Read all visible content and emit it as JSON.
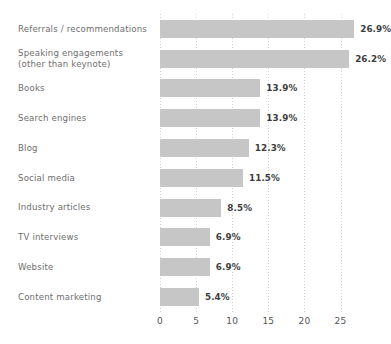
{
  "chart_data": {
    "type": "bar",
    "orientation": "horizontal",
    "title": "",
    "subtitle": "",
    "xlabel": "",
    "ylabel": "",
    "xlim": [
      0,
      28
    ],
    "xticks": [
      0,
      5,
      10,
      15,
      20,
      25
    ],
    "xtick_labels": [
      "0",
      "5",
      "10",
      "15",
      "20",
      "25"
    ],
    "grid": true,
    "grid_axis": "x",
    "grid_style": "dotted",
    "legend": false,
    "value_label_suffix": "%",
    "categories": [
      "Referrals / recommendations",
      "Speaking engagements\n(other than keynote)",
      "Books",
      "Search engines",
      "Blog",
      "Social media",
      "Industry articles",
      "TV interviews",
      "Website",
      "Content marketing"
    ],
    "values": [
      26.9,
      26.2,
      13.9,
      13.9,
      12.3,
      11.5,
      8.5,
      6.9,
      6.9,
      5.4
    ],
    "value_labels": [
      "26.9%",
      "26.2%",
      "13.9%",
      "13.9%",
      "12.3%",
      "11.5%",
      "8.5%",
      "6.9%",
      "6.9%",
      "5.4%"
    ],
    "colors": {
      "bar": "#c6c6c6",
      "background": "#ffffff",
      "grid": "#d4d4d4",
      "category_label": "#6e6e6e",
      "value_label": "#3d3d3d",
      "tick_label": "#555555"
    }
  }
}
